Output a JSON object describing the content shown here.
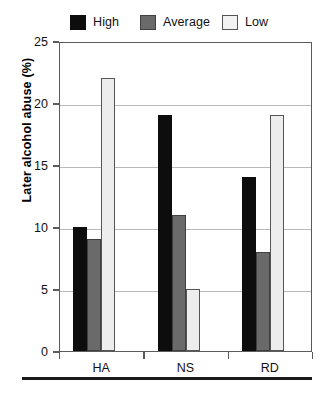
{
  "chart_data": {
    "type": "bar",
    "title": "",
    "subtitle": "",
    "xlabel": "",
    "ylabel": "Later alcohol abuse (%)",
    "categories": [
      "HA",
      "NS",
      "RD"
    ],
    "series": [
      {
        "name": "High",
        "values": [
          10,
          19,
          14
        ],
        "color": "#0d0d0d",
        "border": "#0d0d0d"
      },
      {
        "name": "Average",
        "values": [
          9,
          11,
          8
        ],
        "color": "#6a6a6a",
        "border": "#3f3f3f"
      },
      {
        "name": "Low",
        "values": [
          22,
          5,
          19
        ],
        "color": "#ededed",
        "border": "#555555"
      }
    ],
    "ylim": [
      0,
      25
    ],
    "yticks": [
      0,
      5,
      10,
      15,
      20,
      25
    ],
    "ytick_labels": [
      "0",
      "5",
      "10",
      "15",
      "20",
      "25"
    ],
    "grid": true,
    "grid_axis": "y",
    "legend_position": "top"
  },
  "legend": {
    "items": [
      {
        "label": "High",
        "swatch": "legend-swatch-high"
      },
      {
        "label": "Average",
        "swatch": "legend-swatch-average"
      },
      {
        "label": "Low",
        "swatch": "legend-swatch-low"
      }
    ]
  },
  "axes": {
    "y_title": "Later alcohol abuse (%)",
    "y_labels": [
      "25",
      "20",
      "15",
      "10",
      "5",
      "0"
    ],
    "x_labels": [
      "HA",
      "NS",
      "RD"
    ]
  }
}
